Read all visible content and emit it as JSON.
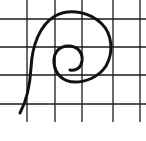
{
  "diagram": {
    "type": "spiral-on-grid",
    "background": "#ffffff",
    "grid": {
      "color": "#1a1a1a",
      "vertical_x": [
        27,
        55,
        82,
        113,
        140
      ],
      "horizontal_y": [
        19,
        47,
        75,
        104
      ],
      "extent": {
        "x0": 0,
        "x1": 146,
        "y0": 0,
        "y1": 122
      }
    },
    "spiral": {
      "color": "#111111",
      "stroke_width": 3,
      "path": "M20,113 C27,100 30,85 31,68 C32,45 40,25 55,16 C70,8 90,12 102,24 C112,34 114,52 106,66 C98,78 85,82 75,82 C63,82 55,74 54,63 C53,52 60,45 70,46 C79,47 83,54 82,61 C81,68 76,71 70,70"
    }
  }
}
